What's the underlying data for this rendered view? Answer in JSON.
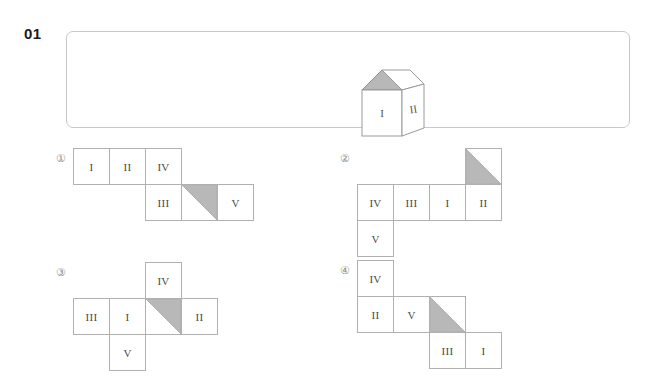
{
  "question": {
    "number": "01",
    "stimulus": {
      "type": "cube-3d",
      "front_face_label": "I",
      "right_face_label": "II",
      "top_face": {
        "shaded_half": "left-triangle",
        "shade_color": "#b8b8b8"
      }
    }
  },
  "options": [
    {
      "marker": "①",
      "name": "option-1",
      "cells": [
        {
          "label": "I",
          "type": "text",
          "col": 0,
          "row": 0
        },
        {
          "label": "II",
          "type": "text",
          "col": 1,
          "row": 0
        },
        {
          "label": "IV",
          "type": "text",
          "col": 2,
          "row": 0
        },
        {
          "label": "III",
          "type": "text",
          "col": 2,
          "row": 1
        },
        {
          "label": "",
          "type": "triangle",
          "orientation": "upper-right",
          "col": 3,
          "row": 1
        },
        {
          "label": "V",
          "type": "text",
          "col": 4,
          "row": 1
        }
      ]
    },
    {
      "marker": "②",
      "name": "option-2",
      "cells": [
        {
          "label": "",
          "type": "triangle",
          "orientation": "lower-left",
          "col": 3,
          "row": 0
        },
        {
          "label": "IV",
          "type": "text",
          "col": 0,
          "row": 1
        },
        {
          "label": "III",
          "type": "text",
          "col": 1,
          "row": 1
        },
        {
          "label": "I",
          "type": "text",
          "col": 2,
          "row": 1
        },
        {
          "label": "II",
          "type": "text",
          "col": 3,
          "row": 1
        },
        {
          "label": "V",
          "type": "text",
          "col": 0,
          "row": 2
        }
      ]
    },
    {
      "marker": "③",
      "name": "option-3",
      "cells": [
        {
          "label": "IV",
          "type": "text",
          "col": 2,
          "row": 0
        },
        {
          "label": "III",
          "type": "text",
          "col": 0,
          "row": 1
        },
        {
          "label": "I",
          "type": "text",
          "col": 1,
          "row": 1
        },
        {
          "label": "",
          "type": "triangle",
          "orientation": "upper-right",
          "col": 2,
          "row": 1
        },
        {
          "label": "II",
          "type": "text",
          "col": 3,
          "row": 1
        },
        {
          "label": "V",
          "type": "text",
          "col": 1,
          "row": 2
        }
      ]
    },
    {
      "marker": "④",
      "name": "option-4",
      "cells": [
        {
          "label": "IV",
          "type": "text",
          "col": 0,
          "row": 0
        },
        {
          "label": "II",
          "type": "text",
          "col": 0,
          "row": 1
        },
        {
          "label": "V",
          "type": "text",
          "col": 1,
          "row": 1
        },
        {
          "label": "",
          "type": "triangle",
          "orientation": "lower-left",
          "col": 2,
          "row": 1
        },
        {
          "label": "III",
          "type": "text",
          "col": 2,
          "row": 2
        },
        {
          "label": "I",
          "type": "text",
          "col": 3,
          "row": 2
        }
      ]
    }
  ],
  "style": {
    "cell_size": 37,
    "shade_color": "#b8b8b8",
    "line_color": "#b0b0b0",
    "box_border_color": "#c9c9c9"
  }
}
